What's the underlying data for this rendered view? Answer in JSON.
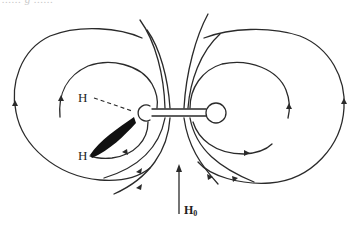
{
  "figure": {
    "top_cutoff_text": "...... g ......",
    "atoms": {
      "h_upper": "H",
      "h_lower": "H"
    },
    "field": {
      "label_main": "H",
      "label_sub": "0"
    },
    "colors": {
      "stroke": "#2a2a2a",
      "background": "#ffffff"
    }
  }
}
